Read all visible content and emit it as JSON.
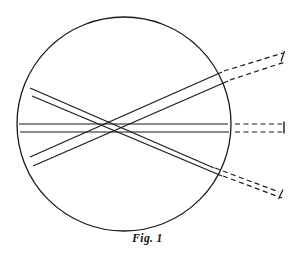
{
  "figure": {
    "caption": "Fig. 1",
    "title": "Fig. 1",
    "background_color": "#ffffff",
    "stroke_color": "#1a1a1a",
    "canvas": {
      "width": 295,
      "height": 259
    },
    "lens": {
      "name": "circle-outline",
      "shape": "circle",
      "center_x": 124,
      "center_y": 124,
      "radius": 107,
      "stroke_width": 1.3,
      "fill": "none"
    },
    "ray_bundles": [
      {
        "id": "bundle-upper-left-to-lower-right",
        "label": "descending ray bundle",
        "style": "solid",
        "stroke_width": 1.2,
        "rays": [
          {
            "x1": 30,
            "y1": 88,
            "x2": 214,
            "y2": 168
          },
          {
            "x1": 32,
            "y1": 96,
            "x2": 222,
            "y2": 176
          }
        ]
      },
      {
        "id": "bundle-horizontal-middle",
        "label": "axial ray bundle",
        "style": "solid",
        "stroke_width": 1.2,
        "rays": [
          {
            "x1": 19,
            "y1": 124,
            "x2": 228,
            "y2": 124
          },
          {
            "x1": 20,
            "y1": 132,
            "x2": 229,
            "y2": 132
          }
        ]
      },
      {
        "id": "bundle-lower-left-to-upper-right",
        "label": "ascending ray bundle",
        "style": "solid",
        "stroke_width": 1.2,
        "rays": [
          {
            "x1": 30,
            "y1": 157,
            "x2": 222,
            "y2": 72
          },
          {
            "x1": 33,
            "y1": 166,
            "x2": 228,
            "y2": 81
          }
        ]
      }
    ],
    "dashed_extensions": [
      {
        "id": "dashed-upper-right",
        "label": "virtual image ray pair upper",
        "style": "dashed",
        "dash_pattern": "5,3.5",
        "stroke_width": 1.2,
        "rays": [
          {
            "x1": 222,
            "y1": 72,
            "x2": 283,
            "y2": 53
          },
          {
            "x1": 228,
            "y1": 81,
            "x2": 285,
            "y2": 62
          }
        ],
        "end_tick": {
          "x1": 284,
          "y1": 51,
          "x2": 281,
          "y2": 61
        }
      },
      {
        "id": "dashed-middle-right",
        "label": "virtual image ray pair middle",
        "style": "dashed",
        "dash_pattern": "5,3.5",
        "stroke_width": 1.2,
        "rays": [
          {
            "x1": 236,
            "y1": 124,
            "x2": 283,
            "y2": 124
          },
          {
            "x1": 236,
            "y1": 132,
            "x2": 283,
            "y2": 132
          }
        ],
        "end_tick": {
          "x1": 284,
          "y1": 122,
          "x2": 284,
          "y2": 133
        }
      },
      {
        "id": "dashed-lower-right",
        "label": "virtual image ray pair lower",
        "style": "dashed",
        "dash_pattern": "5,3.5",
        "stroke_width": 1.2,
        "rays": [
          {
            "x1": 214,
            "y1": 168,
            "x2": 279,
            "y2": 192
          },
          {
            "x1": 222,
            "y1": 176,
            "x2": 282,
            "y2": 198
          }
        ],
        "end_tick": {
          "x1": 283,
          "y1": 190,
          "x2": 279,
          "y2": 199
        }
      }
    ],
    "crossing_point": {
      "x": 124,
      "y": 128,
      "label": "ray crossing / focus"
    }
  }
}
